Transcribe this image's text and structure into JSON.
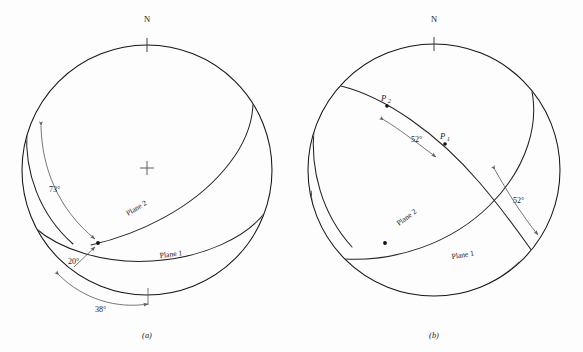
{
  "figure": {
    "type": "stereographic-projection-pair",
    "width": 583,
    "height": 352,
    "background_color": "#fdfdfd",
    "line_color": "#1a1a1a",
    "annotation_color": "#5e5e5e"
  },
  "panel_a": {
    "caption": "(a)",
    "north_label": "N",
    "center": {
      "x": 147,
      "y": 170
    },
    "radius": 125,
    "has_center_cross": true,
    "plane_labels": [
      {
        "key": "plane1",
        "text": "Plane 1"
      },
      {
        "key": "plane2",
        "text": "Plane 2"
      }
    ],
    "angle_labels": [
      {
        "key": "a73",
        "text": "73°",
        "meaning": "pitch-measured-along-plane-2"
      },
      {
        "key": "a20",
        "text": "20°",
        "meaning": "angle-between-plane-traces"
      },
      {
        "key": "a38",
        "text": "38°",
        "meaning": "strike-difference-on-primitive"
      }
    ],
    "intersection_marked": true
  },
  "panel_b": {
    "caption": "(b)",
    "north_label": "N",
    "center": {
      "x": 434,
      "y": 170
    },
    "radius": 126,
    "has_center_cross": false,
    "plane_labels": [
      {
        "key": "plane1",
        "text": "Plane 1"
      },
      {
        "key": "plane2",
        "text": "Plane 2"
      }
    ],
    "point_labels": [
      {
        "key": "p1",
        "base": "P",
        "sub": "1"
      },
      {
        "key": "p2",
        "base": "P",
        "sub": "2"
      }
    ],
    "angle_labels": [
      {
        "key": "b52_upper",
        "text": "52°",
        "meaning": "angle-between-P1-and-P2"
      },
      {
        "key": "b52_lower",
        "text": "52°",
        "meaning": "equivalent-angle-lower-arc"
      }
    ],
    "intersection_marked": true
  }
}
